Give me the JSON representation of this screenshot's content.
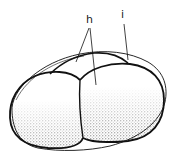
{
  "figure": {
    "type": "biological line drawing",
    "labels": [
      {
        "id": "h",
        "text": "h",
        "x": 86,
        "y": 14,
        "points_to": [
          "upper cap region",
          "right lobe center"
        ]
      },
      {
        "id": "i",
        "text": "i",
        "x": 121,
        "y": 8,
        "points_to": [
          "outer envelope"
        ]
      }
    ],
    "colors": {
      "line": "#111111",
      "stipple": "#2a2a2a",
      "background": "#ffffff"
    }
  }
}
